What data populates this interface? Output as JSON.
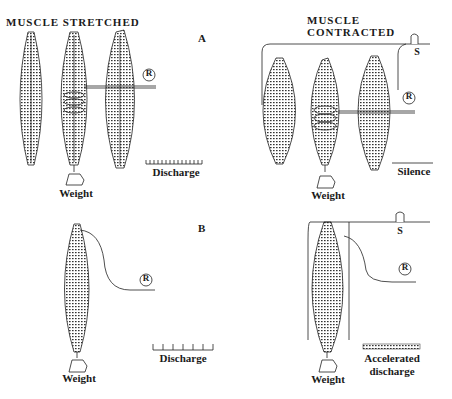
{
  "titles": {
    "left": "MUSCLE STRETCHED",
    "right": "MUSCLE CONTRACTED"
  },
  "panels": {
    "A": "A",
    "B": "B"
  },
  "labels": {
    "weight": "Weight",
    "recorder": "R",
    "switch": "S"
  },
  "outputs": {
    "a_stretched": "Discharge",
    "a_contracted": "Silence",
    "b_stretched": "Discharge",
    "b_contracted_line1": "Accelerated",
    "b_contracted_line2": "discharge"
  }
}
